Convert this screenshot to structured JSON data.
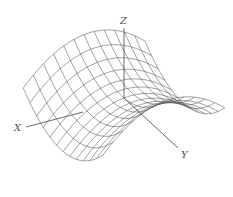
{
  "figure": {
    "type": "3d-wireframe-surface",
    "surface": "saddle (hyperbolic paraboloid)",
    "equation_form": "z = y^2 - x^2",
    "line_color": "#555555",
    "background": "#ffffff"
  },
  "axes": {
    "x": {
      "label": "X",
      "from": [
        83,
        112
      ],
      "to": [
        26,
        127
      ],
      "label_pos": [
        14,
        131
      ]
    },
    "y": {
      "label": "Y",
      "from": [
        124,
        98
      ],
      "to": [
        178,
        148
      ],
      "label_pos": [
        181,
        158
      ]
    },
    "z": {
      "label": "Z",
      "from": [
        124,
        98
      ],
      "to": [
        124,
        28
      ],
      "label_pos": [
        120,
        24
      ]
    }
  },
  "projection": {
    "origin": [
      124,
      98
    ],
    "ex": [
      -1.6,
      0.62
    ],
    "ey": [
      1.05,
      0.88
    ],
    "ez": [
      0,
      -1.0
    ],
    "scale": 38,
    "zscale": 30
  },
  "grid": {
    "u_range": [
      -1,
      1
    ],
    "v_range": [
      -1,
      1
    ],
    "u_lines": 13,
    "v_lines": 13,
    "samples": 30
  }
}
